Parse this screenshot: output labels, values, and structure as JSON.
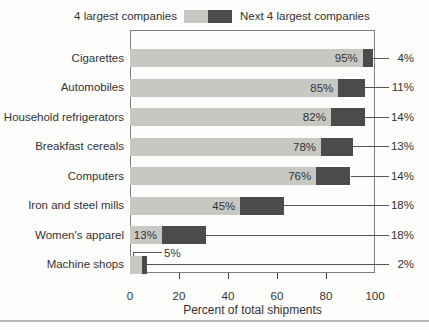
{
  "legend": {
    "left_label": "4 largest companies",
    "right_label": "Next 4 largest companies"
  },
  "colors": {
    "series_top4": "#c7c8c4",
    "series_next4": "#4b4b49",
    "frame": "#7f7f7f",
    "connector_line": "#555555",
    "text": "#333333",
    "divider": "#b5b8ba",
    "background": "#fdfdfc"
  },
  "chart_data": {
    "type": "bar",
    "orientation": "horizontal",
    "stacked": true,
    "title": "",
    "categories": [
      "Cigarettes",
      "Automobiles",
      "Household refrigerators",
      "Breakfast cereals",
      "Computers",
      "Iron and steel mills",
      "Women's apparel",
      "Machine shops"
    ],
    "series": [
      {
        "name": "4 largest companies",
        "color": "#c7c8c4",
        "values": [
          95,
          85,
          82,
          78,
          76,
          45,
          13,
          5
        ],
        "labels": [
          "95%",
          "85%",
          "82%",
          "78%",
          "76%",
          "45%",
          "13%",
          "5%"
        ]
      },
      {
        "name": "Next 4 largest companies",
        "color": "#4b4b49",
        "values": [
          4,
          11,
          14,
          13,
          14,
          18,
          18,
          2
        ],
        "labels": [
          "4%",
          "11%",
          "14%",
          "13%",
          "14%",
          "18%",
          "18%",
          "2%"
        ]
      }
    ],
    "label_placement": [
      "inside",
      "inside",
      "inside",
      "inside",
      "inside",
      "inside",
      "inside",
      "callout"
    ],
    "xlabel": "Percent of total shipments",
    "xlim": [
      0,
      100
    ],
    "xticks": [
      0,
      20,
      40,
      60,
      80,
      100
    ],
    "xtick_labels": [
      "0",
      "20",
      "40",
      "60",
      "80",
      "100"
    ],
    "ticks_with_marks": [
      20,
      40,
      60,
      80
    ],
    "grid": false,
    "legend_position": "top"
  }
}
